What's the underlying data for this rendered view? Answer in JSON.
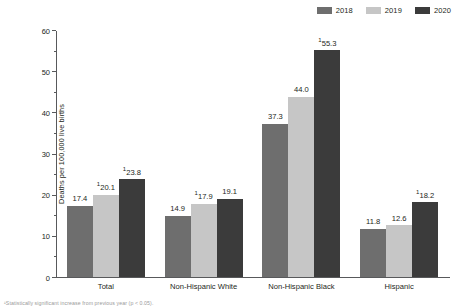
{
  "legend": {
    "position": "top-right",
    "items": [
      {
        "label": "2018",
        "color": "#6e6e6e"
      },
      {
        "label": "2019",
        "color": "#c6c6c6"
      },
      {
        "label": "2020",
        "color": "#3b3b3b"
      }
    ]
  },
  "footnote": {
    "text": "¹Statistically significant increase from previous year (p < 0.05)."
  },
  "chart_data": {
    "type": "bar",
    "title": "",
    "xlabel": "",
    "ylabel": "Deaths per 100,000 live births",
    "ylim": [
      0,
      60
    ],
    "yticks": [
      0,
      10,
      20,
      30,
      40,
      50,
      60
    ],
    "ytick_labels": [
      "0",
      "10",
      "20",
      "30",
      "40",
      "50",
      "60"
    ],
    "yminor_ticks": [
      5,
      15,
      25,
      35,
      45,
      55
    ],
    "grid": false,
    "legend_position": "top-right",
    "categories": [
      "Total",
      "Non-Hispanic White",
      "Non-Hispanic Black",
      "Hispanic"
    ],
    "series": [
      {
        "name": "2018",
        "color": "#6e6e6e",
        "values": [
          17.4,
          14.9,
          37.3,
          11.8
        ],
        "labels": [
          "17.4",
          "14.9",
          "37.3",
          "11.8"
        ],
        "marked": [
          false,
          false,
          false,
          false
        ]
      },
      {
        "name": "2019",
        "color": "#c6c6c6",
        "values": [
          20.1,
          17.9,
          44.0,
          12.6
        ],
        "labels": [
          "20.1",
          "17.9",
          "44.0",
          "12.6"
        ],
        "marked": [
          true,
          true,
          false,
          false
        ]
      },
      {
        "name": "2020",
        "color": "#3b3b3b",
        "values": [
          23.8,
          19.1,
          55.3,
          18.2
        ],
        "labels": [
          "23.8",
          "19.1",
          "55.3",
          "18.2"
        ],
        "marked": [
          true,
          false,
          true,
          true
        ]
      }
    ],
    "marker_symbol": "1"
  }
}
